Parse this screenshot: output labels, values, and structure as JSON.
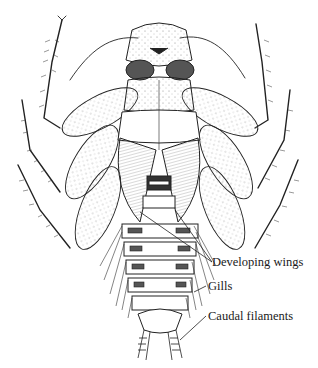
{
  "figure": {
    "labels": [
      {
        "id": "developing-wings",
        "text": "Developing wings",
        "x": 212,
        "y": 262
      },
      {
        "id": "gills",
        "text": "Gills",
        "x": 208,
        "y": 286
      },
      {
        "id": "caudal-filements",
        "text": "Caudal filaments",
        "x": 208,
        "y": 316
      }
    ],
    "ink_color": "#222222",
    "stipple_color": "#555555"
  }
}
